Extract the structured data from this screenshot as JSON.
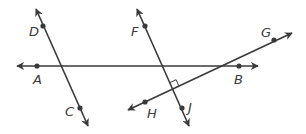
{
  "diagram": {
    "type": "geometry-lines",
    "colors": {
      "line": "#3a3a3a",
      "background": "#ffffff"
    },
    "lines": [
      {
        "name": "AB",
        "from": [
          17,
          66
        ],
        "to": [
          258,
          66
        ],
        "arrows": "both"
      },
      {
        "name": "DC",
        "from": [
          36,
          9
        ],
        "to": [
          88,
          126
        ],
        "arrows": "both"
      },
      {
        "name": "FJ",
        "from": [
          137,
          9
        ],
        "to": [
          189,
          126
        ],
        "arrows": "both"
      },
      {
        "name": "HG",
        "from": [
          128,
          110
        ],
        "to": [
          292,
          33
        ],
        "arrows": "both"
      }
    ],
    "points": [
      {
        "label": "A",
        "x": 37,
        "y": 66,
        "lx": 33,
        "ly": 84
      },
      {
        "label": "B",
        "x": 239,
        "y": 66,
        "lx": 234,
        "ly": 84
      },
      {
        "label": "C",
        "x": 80,
        "y": 108,
        "lx": 65,
        "ly": 116
      },
      {
        "label": "D",
        "x": 43,
        "y": 26,
        "lx": 29,
        "ly": 36
      },
      {
        "label": "F",
        "x": 145,
        "y": 26,
        "lx": 131,
        "ly": 36
      },
      {
        "label": "G",
        "x": 274,
        "y": 40,
        "lx": 261,
        "ly": 37
      },
      {
        "label": "H",
        "x": 145,
        "y": 102,
        "lx": 147,
        "ly": 118
      },
      {
        "label": "J",
        "x": 182,
        "y": 108,
        "lx": 188,
        "ly": 112
      }
    ],
    "annotations": [
      {
        "type": "right-angle",
        "between": [
          "FJ",
          "HG"
        ],
        "at": [
          174,
          88
        ]
      }
    ]
  }
}
